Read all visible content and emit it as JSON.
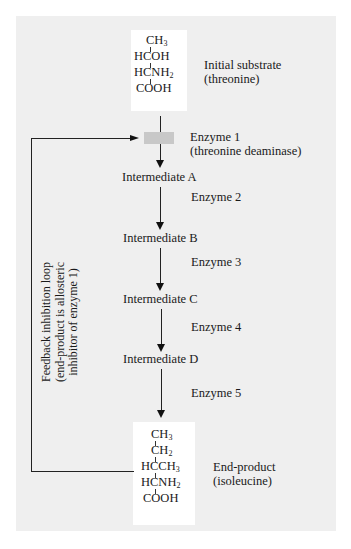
{
  "substrate": {
    "formula_rows": [
      "CH3",
      "HCOH",
      "HCNH2",
      "COOH"
    ],
    "label_line1": "Initial substrate",
    "label_line2": "(threonine)"
  },
  "enzyme1": {
    "label_line1": "Enzyme 1",
    "label_line2": "(threonine deaminase)"
  },
  "steps": [
    {
      "intermediate": "Intermediate A",
      "enzyme": "Enzyme 2"
    },
    {
      "intermediate": "Intermediate B",
      "enzyme": "Enzyme 3"
    },
    {
      "intermediate": "Intermediate C",
      "enzyme": "Enzyme 4"
    },
    {
      "intermediate": "Intermediate D",
      "enzyme": "Enzyme 5"
    }
  ],
  "product": {
    "formula_rows": [
      "CH3",
      "CH2",
      "HCCH3",
      "HCNH2",
      "COOH"
    ],
    "label_line1": "End-product",
    "label_line2": "(isoleucine)"
  },
  "feedback": {
    "line1": "Feedback inhibition loop",
    "line2": "(end-product is allosteric",
    "line3": "inhibitor of enzyme 1)"
  },
  "colors": {
    "panel": "#efefef",
    "box": "#ffffff",
    "enzyme_block": "#c8c8c8",
    "line": "#222222"
  }
}
